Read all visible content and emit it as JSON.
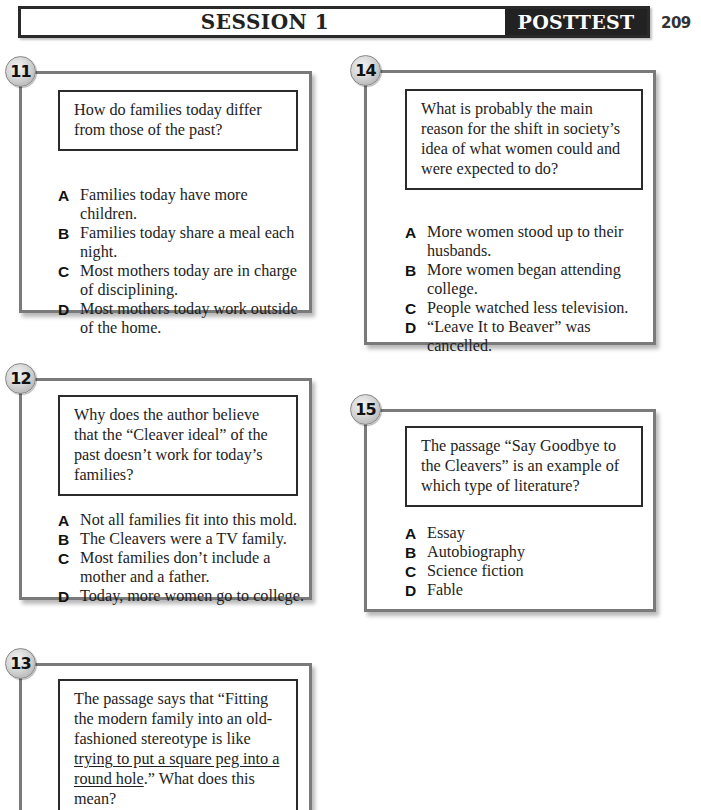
{
  "header": {
    "session_label": "SESSION 1",
    "test_label": "POSTTEST",
    "page_number": "209"
  },
  "colors": {
    "header_dark": "#222222",
    "card_border": "#7a7a7a",
    "stem_border": "#2b2b2b",
    "badge_fill": "#d6d6d6"
  },
  "questions": [
    {
      "number": "11",
      "stem": "How do families today differ from those of the past?",
      "choices": [
        {
          "letter": "A",
          "text": "Families today have more children."
        },
        {
          "letter": "B",
          "text": "Families today share a meal each night."
        },
        {
          "letter": "C",
          "text": "Most mothers today are in charge of disciplining."
        },
        {
          "letter": "D",
          "text": "Most mothers today work outside of the home."
        }
      ]
    },
    {
      "number": "12",
      "stem": "Why does the author believe that the “Cleaver ideal” of the past doesn’t work for today’s families?",
      "choices": [
        {
          "letter": "A",
          "text": "Not all families fit into this mold."
        },
        {
          "letter": "B",
          "text": "The Cleavers were a TV family."
        },
        {
          "letter": "C",
          "text": "Most families don’t include a mother and a father."
        },
        {
          "letter": "D",
          "text": "Today, more women go to college."
        }
      ]
    },
    {
      "number": "13",
      "stem_before": "The passage says that “Fitting the modern family into an old-fashioned stereotype is like ",
      "stem_underlined": "trying to put a square peg into a round hole",
      "stem_after": ".” What does this mean?",
      "choices": []
    },
    {
      "number": "14",
      "stem": "What is probably the main reason for the shift in society’s idea of what women could and were expected to do?",
      "choices": [
        {
          "letter": "A",
          "text": "More women stood up to their husbands."
        },
        {
          "letter": "B",
          "text": "More women began attending college."
        },
        {
          "letter": "C",
          "text": "People watched less television."
        },
        {
          "letter": "D",
          "text": "“Leave It to Beaver” was cancelled."
        }
      ]
    },
    {
      "number": "15",
      "stem": "The passage “Say Goodbye to the Cleavers” is an example of which type of literature?",
      "choices": [
        {
          "letter": "A",
          "text": "Essay"
        },
        {
          "letter": "B",
          "text": "Autobiography"
        },
        {
          "letter": "C",
          "text": "Science fiction"
        },
        {
          "letter": "D",
          "text": "Fable"
        }
      ]
    }
  ]
}
